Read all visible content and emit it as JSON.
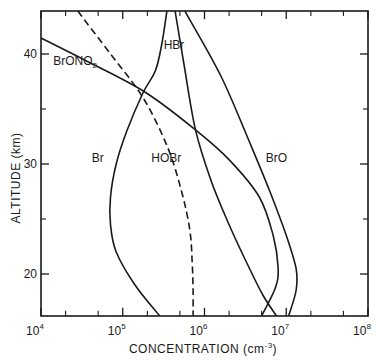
{
  "chart_data": {
    "type": "line",
    "title": "",
    "xlabel": "CONCENTRATION (cm",
    "xlabel_sup": "-3",
    "xlabel_close": ")",
    "ylabel": "ALTITUDE (km)",
    "xscale": "log",
    "xlim": [
      10000,
      100000000
    ],
    "ylim": [
      16.2,
      43.9
    ],
    "grid": false,
    "legend": "inline-labels",
    "x_ticks": [
      {
        "base": "10",
        "exp": "4",
        "value": 10000
      },
      {
        "base": "10",
        "exp": "5",
        "value": 100000
      },
      {
        "base": "10",
        "exp": "6",
        "value": 1000000
      },
      {
        "base": "10",
        "exp": "7",
        "value": 10000000
      },
      {
        "base": "10",
        "exp": "8",
        "value": 100000000
      }
    ],
    "y_ticks": [
      {
        "label": "20",
        "value": 20
      },
      {
        "label": "30",
        "value": 30
      },
      {
        "label": "40",
        "value": 40
      }
    ],
    "y_minor_ticks": [
      25,
      35
    ],
    "series": [
      {
        "name": "BrONO2",
        "label": "BrONO",
        "label_sub": "2",
        "style": "solid",
        "log10_concentration": [
          4.0,
          4.6,
          5.28,
          5.89,
          6.3,
          6.67,
          6.84,
          6.9,
          6.87,
          6.7
        ],
        "altitude_km": [
          41.45,
          39.2,
          36.5,
          33.1,
          30.4,
          27.0,
          23.5,
          20.6,
          18.8,
          16.2
        ]
      },
      {
        "name": "Br",
        "label": "Br",
        "style": "solid",
        "log10_concentration": [
          5.54,
          5.48,
          5.4,
          5.25,
          5.05,
          4.92,
          4.85,
          4.85,
          4.92,
          5.15,
          5.45
        ],
        "altitude_km": [
          43.9,
          41.0,
          38.5,
          36.5,
          33.0,
          30.0,
          27.0,
          24.5,
          22.0,
          19.0,
          16.2
        ]
      },
      {
        "name": "HOBr",
        "label": "HOBr",
        "style": "dashed",
        "log10_concentration": [
          4.45,
          4.85,
          5.25,
          5.55,
          5.72,
          5.82,
          5.85,
          5.86,
          5.86
        ],
        "altitude_km": [
          43.9,
          40.0,
          36.0,
          31.5,
          27.5,
          24.0,
          21.0,
          18.5,
          16.2
        ]
      },
      {
        "name": "HBr",
        "label": "HBr",
        "style": "solid",
        "log10_concentration": [
          5.64,
          5.75,
          5.89,
          6.08,
          6.3,
          6.55,
          6.72,
          6.88
        ],
        "altitude_km": [
          43.9,
          39.0,
          33.1,
          28.5,
          24.5,
          20.5,
          18.0,
          16.2
        ]
      },
      {
        "name": "BrO",
        "label": "BrO",
        "style": "solid",
        "log10_concentration": [
          5.76,
          6.2,
          6.55,
          6.8,
          7.0,
          7.12,
          7.12,
          7.03
        ],
        "altitude_km": [
          43.9,
          38.0,
          32.0,
          27.5,
          23.5,
          20.5,
          18.5,
          16.2
        ]
      }
    ],
    "annotations": [
      {
        "series": "BrONO2",
        "log10_x": 4.15,
        "alt": 39.0
      },
      {
        "series": "HBr",
        "log10_x": 5.5,
        "alt": 40.5
      },
      {
        "series": "Br",
        "log10_x": 4.62,
        "alt": 30.2
      },
      {
        "series": "HOBr",
        "log10_x": 5.35,
        "alt": 30.2
      },
      {
        "series": "BrO",
        "log10_x": 6.75,
        "alt": 30.2
      }
    ]
  }
}
